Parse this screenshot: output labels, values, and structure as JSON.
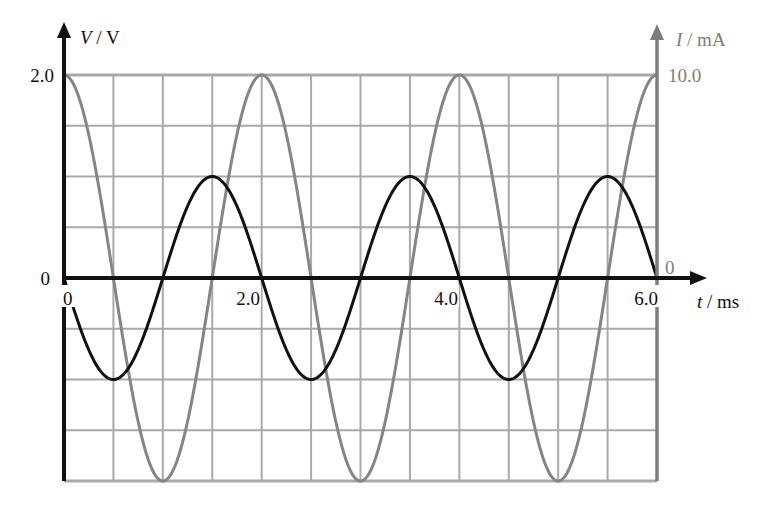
{
  "chart_data": {
    "type": "line",
    "title": "",
    "xlabel": "t / ms",
    "ylabel_left": "V / V",
    "ylabel_right": "I / mA",
    "x_ticks": [
      "0",
      "2.0",
      "4.0",
      "6.0"
    ],
    "y_left_ticks": [
      "2.0",
      "0"
    ],
    "y_right_ticks": [
      "10.0",
      "0"
    ],
    "xlim": [
      0,
      6.0
    ],
    "ylim_left": [
      -2.0,
      2.0
    ],
    "ylim_right": [
      -10.0,
      10.0
    ],
    "grid": true,
    "grid_x_step_ms": 0.5,
    "grid_y_step_V": 0.5,
    "series": [
      {
        "name": "V (voltage)",
        "axis": "left",
        "color": "#111111",
        "function": "V = -1.0 sin(2π t / 2.0)",
        "amplitude": 1.0,
        "period_ms": 2.0,
        "x": [
          0,
          0.5,
          1.0,
          1.5,
          2.0,
          2.5,
          3.0,
          3.5,
          4.0,
          4.5,
          5.0,
          5.5,
          6.0
        ],
        "values": [
          0,
          -1.0,
          0,
          1.0,
          0,
          -1.0,
          0,
          1.0,
          0,
          -1.0,
          0,
          1.0,
          0
        ]
      },
      {
        "name": "I (current)",
        "axis": "right",
        "color": "#858585",
        "function": "I = 10.0 cos(2π t / 2.0)",
        "amplitude": 10.0,
        "period_ms": 2.0,
        "x": [
          0,
          0.5,
          1.0,
          1.5,
          2.0,
          2.5,
          3.0,
          3.5,
          4.0,
          4.5,
          5.0,
          5.5,
          6.0
        ],
        "values": [
          10.0,
          0,
          -10.0,
          0,
          10.0,
          0,
          -10.0,
          0,
          10.0,
          0,
          -10.0,
          0,
          10.0
        ]
      }
    ]
  },
  "labels": {
    "v_axis_var": "V",
    "v_axis_unit": " / V",
    "i_axis_var": "I",
    "i_axis_unit": " / mA",
    "t_axis_var": "t",
    "t_axis_unit": " / ms",
    "v_top": "2.0",
    "v_zero": "0",
    "i_top": "10.0",
    "i_zero": "0",
    "t0": "0",
    "t2": "2.0",
    "t4": "4.0",
    "t6": "6.0"
  }
}
